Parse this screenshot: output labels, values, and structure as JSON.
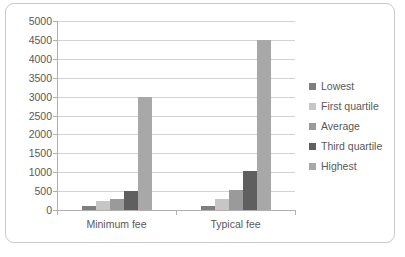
{
  "chart_data": {
    "type": "bar",
    "title": "",
    "subtitle": "",
    "xlabel": "",
    "ylabel": "",
    "categories": [
      "Minimum fee",
      "Typical fee"
    ],
    "series": [
      {
        "name": "Lowest",
        "values": [
          100,
          100
        ],
        "color": "#7f7f7f"
      },
      {
        "name": "First quartile",
        "values": [
          230,
          300
        ],
        "color": "#c6c6c6"
      },
      {
        "name": "Average",
        "values": [
          300,
          520
        ],
        "color": "#9a9a9a"
      },
      {
        "name": "Third quartile",
        "values": [
          500,
          1020
        ],
        "color": "#5f5f5f"
      },
      {
        "name": "Highest",
        "values": [
          3000,
          4500
        ],
        "color": "#a8a8a8"
      }
    ],
    "ylim": [
      0,
      5000
    ],
    "y_ticks": [
      0,
      500,
      1000,
      1500,
      2000,
      2500,
      3000,
      3500,
      4000,
      4500,
      5000
    ],
    "y_tick_labels": [
      "0",
      "500",
      "1000",
      "1500",
      "2000",
      "2500",
      "3000",
      "3500",
      "4000",
      "4500",
      "5000"
    ],
    "grid": true,
    "grid_axis": "y",
    "legend": true,
    "legend_position": "right",
    "legend_entries": [
      "Lowest",
      "First quartile",
      "Average",
      "Third quartile",
      "Highest"
    ],
    "background_color": "#ffffff",
    "grid_color": "#d2d2d2",
    "axis_color": "#b0b0b0",
    "text_color": "#595959",
    "border_color": "#c9c9c9"
  }
}
